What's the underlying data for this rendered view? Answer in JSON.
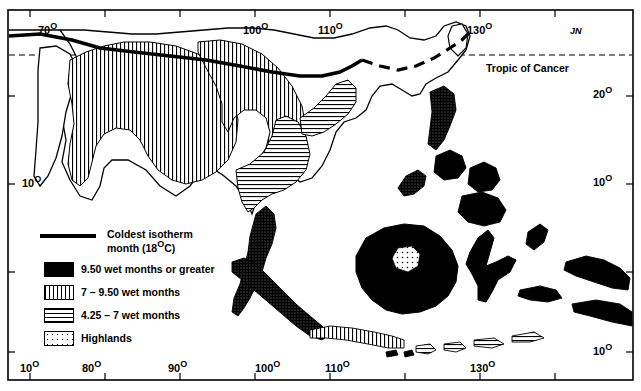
{
  "map": {
    "title_note": "JN",
    "tropic_label": "Tropic of Cancer",
    "top_axis_labels": [
      {
        "text": "70",
        "deg": "O",
        "x": 38,
        "y": 22
      },
      {
        "text": "100",
        "deg": "O",
        "x": 243,
        "y": 22
      },
      {
        "text": "110",
        "deg": "O",
        "x": 318,
        "y": 22
      },
      {
        "text": "130",
        "deg": "O",
        "x": 467,
        "y": 22
      }
    ],
    "bottom_axis_labels": [
      {
        "text": "10",
        "deg": "O",
        "x": 20,
        "y": 362
      },
      {
        "text": "80",
        "deg": "O",
        "x": 82,
        "y": 362
      },
      {
        "text": "90",
        "deg": "O",
        "x": 168,
        "y": 362
      },
      {
        "text": "100",
        "deg": "O",
        "x": 255,
        "y": 362
      },
      {
        "text": "110",
        "deg": "O",
        "x": 325,
        "y": 362
      },
      {
        "text": "130",
        "deg": "O",
        "x": 470,
        "y": 362
      }
    ],
    "left_axis_labels": [
      {
        "text": "10",
        "deg": "O",
        "x": 22,
        "y": 175
      }
    ],
    "right_axis_labels": [
      {
        "text": "20",
        "deg": "O",
        "x": 597,
        "y": 88
      },
      {
        "text": "10",
        "deg": "O",
        "x": 597,
        "y": 175
      },
      {
        "text": "0",
        "deg": "O",
        "x": 600,
        "y": 264
      },
      {
        "text": "10",
        "deg": "O",
        "x": 597,
        "y": 345
      }
    ]
  },
  "legend": {
    "items": [
      {
        "label_line1": "Coldest isotherm",
        "label_line2": "month (18",
        "label_deg": "O",
        "label_line3": "C)",
        "pattern": "thick-line"
      },
      {
        "label_line1": "9.50 wet months or greater",
        "pattern": "dense-stipple"
      },
      {
        "label_line1": "7 – 9.50 wet months",
        "pattern": "vertical-lines"
      },
      {
        "label_line1": "4.25 – 7 wet months",
        "pattern": "horizontal-lines"
      },
      {
        "label_line1": "Highlands",
        "pattern": "sparse-dots"
      }
    ]
  },
  "colors": {
    "ink": "#000000",
    "paper": "#ffffff"
  }
}
